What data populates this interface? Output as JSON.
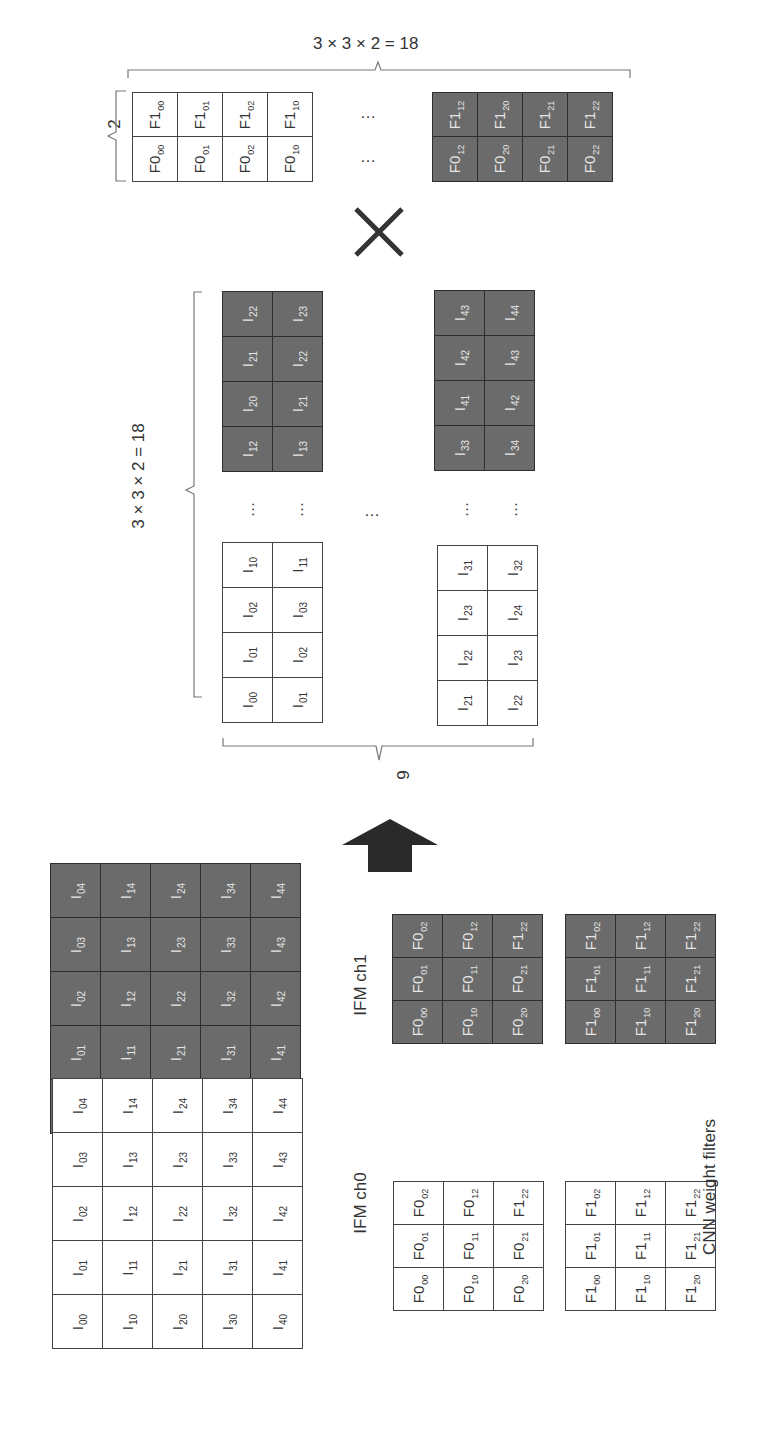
{
  "labels": {
    "filter_matrix_width": "3 × 3 × 2 = 18",
    "filter_matrix_rows": "2",
    "input_matrix_height": "3 × 3 × 2 = 18",
    "input_matrix_cols": "9",
    "ifm_ch0": "IFM ch0",
    "ifm_ch1": "IFM ch1",
    "cnn_weight_filters": "CNN weight filters",
    "ellipsis": "…",
    "multiply_symbol": "×"
  },
  "colors": {
    "light_cell": "#ffffff",
    "dark_cell": "#6b6b6b",
    "border": "#444444",
    "arrow": "#2a2a2a"
  },
  "filter_matrix": {
    "row_f1": {
      "light": [
        [
          "F1",
          "00"
        ],
        [
          "F1",
          "01"
        ],
        [
          "F1",
          "02"
        ],
        [
          "F1",
          "10"
        ]
      ],
      "dark": [
        [
          "F1",
          "12"
        ],
        [
          "F1",
          "20"
        ],
        [
          "F1",
          "21"
        ],
        [
          "F1",
          "22"
        ]
      ]
    },
    "row_f0": {
      "light": [
        [
          "F0",
          "00"
        ],
        [
          "F0",
          "01"
        ],
        [
          "F0",
          "02"
        ],
        [
          "F0",
          "10"
        ]
      ],
      "dark": [
        [
          "F0",
          "12"
        ],
        [
          "F0",
          "20"
        ],
        [
          "F0",
          "21"
        ],
        [
          "F0",
          "22"
        ]
      ]
    }
  },
  "input_matrix": {
    "col_left_light": {
      "a": [
        [
          "I",
          "00"
        ],
        [
          "I",
          "01"
        ],
        [
          "I",
          "02"
        ],
        [
          "I",
          "10"
        ]
      ],
      "b": [
        [
          "I",
          "01"
        ],
        [
          "I",
          "02"
        ],
        [
          "I",
          "03"
        ],
        [
          "I",
          "11"
        ]
      ]
    },
    "col_left_dark": {
      "a": [
        [
          "I",
          "12"
        ],
        [
          "I",
          "20"
        ],
        [
          "I",
          "21"
        ],
        [
          "I",
          "22"
        ]
      ],
      "b": [
        [
          "I",
          "13"
        ],
        [
          "I",
          "21"
        ],
        [
          "I",
          "22"
        ],
        [
          "I",
          "23"
        ]
      ]
    },
    "col_right_light": {
      "a": [
        [
          "I",
          "21"
        ],
        [
          "I",
          "22"
        ],
        [
          "I",
          "23"
        ],
        [
          "I",
          "31"
        ]
      ],
      "b": [
        [
          "I",
          "22"
        ],
        [
          "I",
          "23"
        ],
        [
          "I",
          "24"
        ],
        [
          "I",
          "32"
        ]
      ]
    },
    "col_right_dark": {
      "a": [
        [
          "I",
          "33"
        ],
        [
          "I",
          "41"
        ],
        [
          "I",
          "42"
        ],
        [
          "I",
          "43"
        ]
      ],
      "b": [
        [
          "I",
          "34"
        ],
        [
          "I",
          "42"
        ],
        [
          "I",
          "43"
        ],
        [
          "I",
          "44"
        ]
      ]
    }
  },
  "ifm_ch0_grid": [
    [
      [
        "I",
        "04"
      ],
      [
        "I",
        "14"
      ],
      [
        "I",
        "24"
      ],
      [
        "I",
        "34"
      ],
      [
        "I",
        "44"
      ]
    ],
    [
      [
        "I",
        "03"
      ],
      [
        "I",
        "13"
      ],
      [
        "I",
        "23"
      ],
      [
        "I",
        "33"
      ],
      [
        "I",
        "43"
      ]
    ],
    [
      [
        "I",
        "02"
      ],
      [
        "I",
        "12"
      ],
      [
        "I",
        "22"
      ],
      [
        "I",
        "32"
      ],
      [
        "I",
        "42"
      ]
    ],
    [
      [
        "I",
        "01"
      ],
      [
        "I",
        "11"
      ],
      [
        "I",
        "21"
      ],
      [
        "I",
        "31"
      ],
      [
        "I",
        "41"
      ]
    ],
    [
      [
        "I",
        "00"
      ],
      [
        "I",
        "10"
      ],
      [
        "I",
        "20"
      ],
      [
        "I",
        "30"
      ],
      [
        "I",
        "40"
      ]
    ]
  ],
  "ifm_ch1_grid": [
    [
      [
        "I",
        "04"
      ],
      [
        "I",
        "14"
      ],
      [
        "I",
        "24"
      ],
      [
        "I",
        "34"
      ],
      [
        "I",
        "44"
      ]
    ],
    [
      [
        "I",
        "03"
      ],
      [
        "I",
        "13"
      ],
      [
        "I",
        "23"
      ],
      [
        "I",
        "33"
      ],
      [
        "I",
        "43"
      ]
    ],
    [
      [
        "I",
        "02"
      ],
      [
        "I",
        "12"
      ],
      [
        "I",
        "22"
      ],
      [
        "I",
        "32"
      ],
      [
        "I",
        "42"
      ]
    ],
    [
      [
        "I",
        "01"
      ],
      [
        "I",
        "11"
      ],
      [
        "I",
        "21"
      ],
      [
        "I",
        "31"
      ],
      [
        "I",
        "41"
      ]
    ],
    [
      [
        "I",
        "00"
      ],
      [
        "I",
        "10"
      ],
      [
        "I",
        "20"
      ],
      [
        "I",
        "30"
      ],
      [
        "I",
        "40"
      ]
    ]
  ],
  "filter_f0_dark_grid": [
    [
      [
        "F0",
        "02"
      ],
      [
        "F0",
        "12"
      ],
      [
        "F1",
        "22"
      ]
    ],
    [
      [
        "F0",
        "01"
      ],
      [
        "F0",
        "11"
      ],
      [
        "F0",
        "21"
      ]
    ],
    [
      [
        "F0",
        "00"
      ],
      [
        "F0",
        "10"
      ],
      [
        "F0",
        "20"
      ]
    ]
  ],
  "filter_f1_dark_grid": [
    [
      [
        "F1",
        "02"
      ],
      [
        "F1",
        "12"
      ],
      [
        "F1",
        "22"
      ]
    ],
    [
      [
        "F1",
        "01"
      ],
      [
        "F1",
        "11"
      ],
      [
        "F1",
        "21"
      ]
    ],
    [
      [
        "F1",
        "00"
      ],
      [
        "F1",
        "10"
      ],
      [
        "F1",
        "20"
      ]
    ]
  ],
  "filter_f0_light_grid": [
    [
      [
        "F0",
        "02"
      ],
      [
        "F0",
        "12"
      ],
      [
        "F1",
        "22"
      ]
    ],
    [
      [
        "F0",
        "01"
      ],
      [
        "F0",
        "11"
      ],
      [
        "F0",
        "21"
      ]
    ],
    [
      [
        "F0",
        "00"
      ],
      [
        "F0",
        "10"
      ],
      [
        "F0",
        "20"
      ]
    ]
  ],
  "filter_f1_light_grid": [
    [
      [
        "F1",
        "02"
      ],
      [
        "F1",
        "12"
      ],
      [
        "F1",
        "22"
      ]
    ],
    [
      [
        "F1",
        "01"
      ],
      [
        "F1",
        "11"
      ],
      [
        "F1",
        "21"
      ]
    ],
    [
      [
        "F1",
        "00"
      ],
      [
        "F1",
        "10"
      ],
      [
        "F1",
        "20"
      ]
    ]
  ]
}
